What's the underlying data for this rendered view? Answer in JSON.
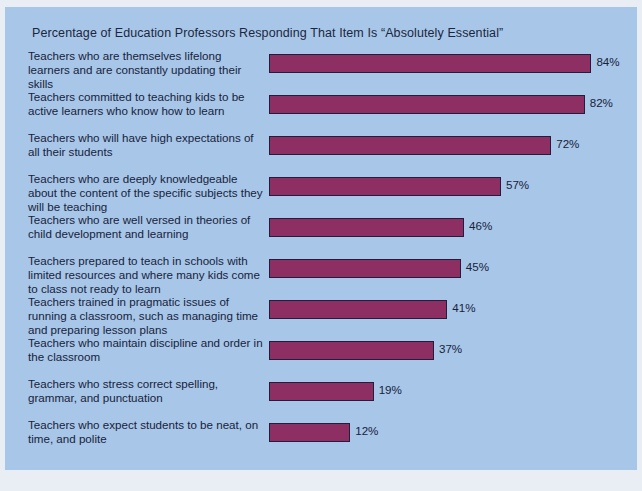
{
  "chart_data": {
    "type": "bar",
    "orientation": "horizontal",
    "title": "Percentage of Education Professors Responding That Item Is “Absolutely Essential”",
    "xlabel": "",
    "ylabel": "",
    "xlim": [
      0,
      100
    ],
    "grid": false,
    "legend": "none",
    "value_suffix": "%",
    "categories": [
      "Teachers who are themselves lifelong learners and are constantly updating their skills",
      "Teachers committed to teaching kids to be active learners who know how to learn",
      "Teachers who will have high expectations of all their students",
      "Teachers who are deeply knowledgeable about the content of the specific subjects they will be teaching",
      "Teachers who are well versed in theories of child development and learning",
      "Teachers prepared to teach in schools with limited resources and where many kids come to class not ready to learn",
      "Teachers trained in pragmatic issues of running a classroom, such as managing time and preparing lesson plans",
      "Teachers who maintain discipline and order in the classroom",
      "Teachers who stress correct spelling, grammar, and punctuation",
      "Teachers who expect students to be neat, on time, and polite"
    ],
    "values": [
      84,
      82,
      72,
      57,
      46,
      45,
      41,
      37,
      19,
      12
    ],
    "value_labels": [
      "84%",
      "82%",
      "72%",
      "57%",
      "46%",
      "45%",
      "41%",
      "37%",
      "19%",
      "12%"
    ]
  },
  "colors": {
    "panel_background": "#a8c6e8",
    "page_background": "#e9eef5",
    "bar_fill": "#8e2f63",
    "bar_border": "#241c3d",
    "text": "#17233c"
  }
}
